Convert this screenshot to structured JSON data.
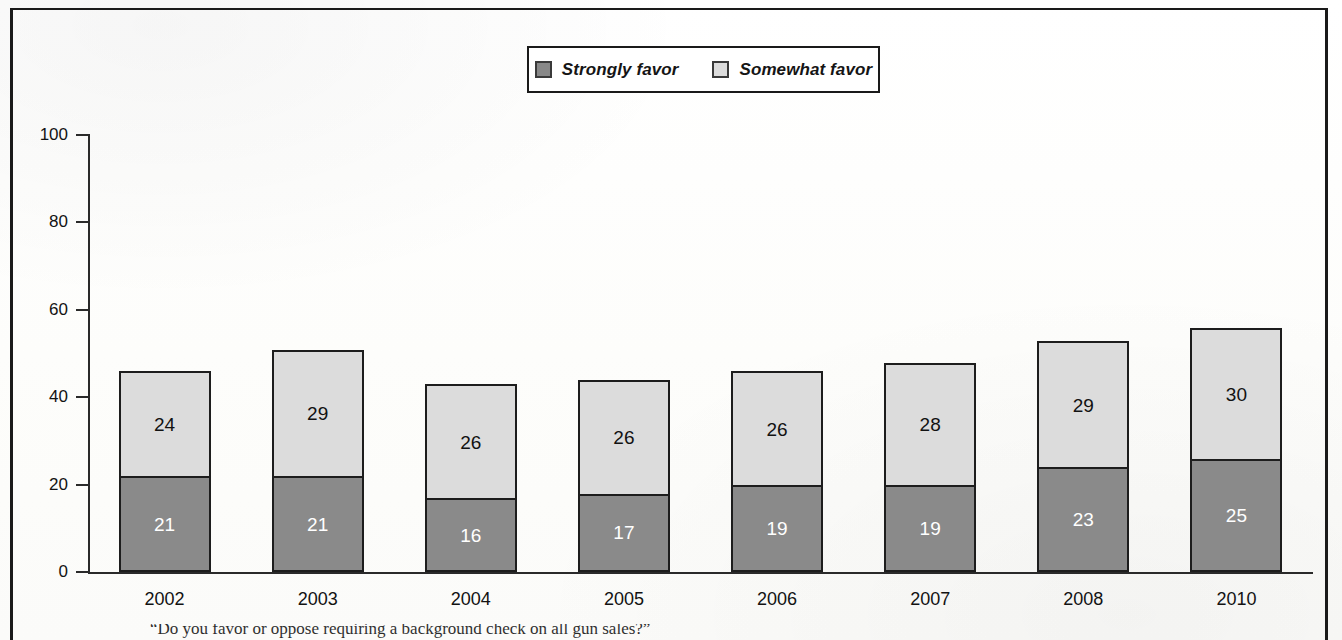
{
  "figure": {
    "frame_color": "#1a1a1a",
    "background": "#ffffff"
  },
  "legend": {
    "position": "top-center",
    "entries": [
      {
        "label": "Strongly favor",
        "color": "#8a8a8a",
        "key": "strongly-favor"
      },
      {
        "label": "Somewhat favor",
        "color": "#dcdcdc",
        "key": "somewhat-favor"
      }
    ]
  },
  "axis": {
    "y_ticks": [
      "0",
      "20",
      "40",
      "60",
      "80",
      "100"
    ],
    "y_min": 0,
    "y_max": 100
  },
  "caption": {
    "text": "“Do you favor or oppose requiring a background check on all gun sales?”"
  },
  "chart_data": {
    "type": "bar",
    "subtype": "stacked-bar",
    "title": "",
    "subtitle": "",
    "xlabel": "",
    "ylabel": "",
    "ylim": [
      0,
      100
    ],
    "yticks": [
      0,
      20,
      40,
      60,
      80,
      100
    ],
    "grid": false,
    "legend_position": "top-center",
    "categories": [
      "2002",
      "2003",
      "2004",
      "2005",
      "2006",
      "2007",
      "2008",
      "2010"
    ],
    "series": [
      {
        "name": "Strongly favor",
        "color": "#8a8a8a",
        "label_color": "#ffffff",
        "values": [
          21,
          21,
          16,
          17,
          19,
          19,
          23,
          25
        ]
      },
      {
        "name": "Somewhat favor",
        "color": "#dcdcdc",
        "label_color": "#121212",
        "values": [
          24,
          29,
          26,
          26,
          26,
          28,
          29,
          30
        ]
      }
    ],
    "totals": [
      45,
      50,
      42,
      43,
      45,
      47,
      52,
      55
    ],
    "annotations": "Total of both segments printed above each bar; segment values printed inside each segment."
  }
}
